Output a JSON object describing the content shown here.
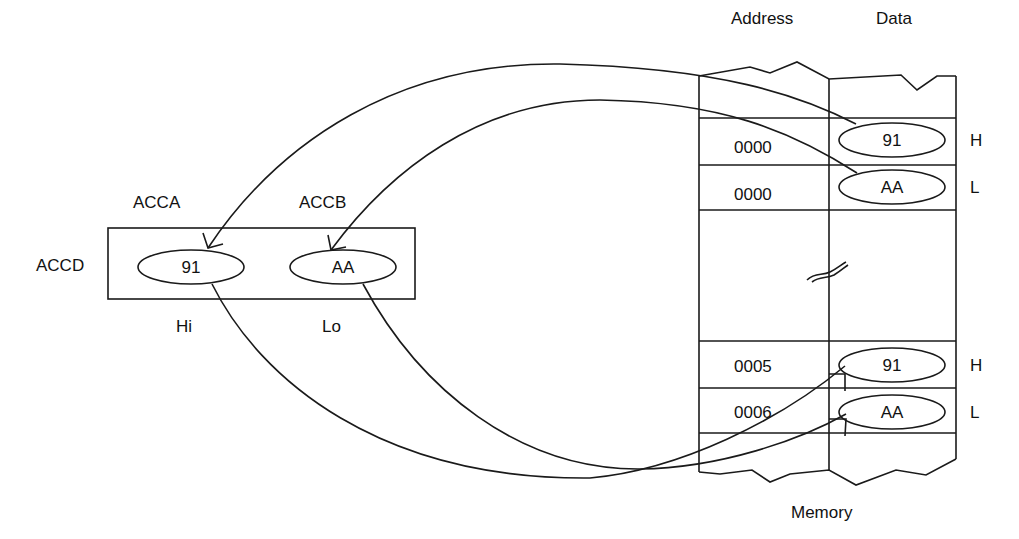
{
  "memory": {
    "title": "Memory",
    "column_headers": {
      "address": "Address",
      "data": "Data"
    },
    "rows": [
      {
        "address": "0000",
        "data": "91",
        "byte": "H"
      },
      {
        "address": "0000",
        "data": "AA",
        "byte": "L"
      },
      {
        "address": "0005",
        "data": "91",
        "byte": "H"
      },
      {
        "address": "0006",
        "data": "AA",
        "byte": "L"
      }
    ],
    "break_symbol": "≈"
  },
  "register": {
    "name": "ACCD",
    "high": {
      "name": "ACCA",
      "value": "91",
      "position": "Hi"
    },
    "low": {
      "name": "ACCB",
      "value": "AA",
      "position": "Lo"
    }
  },
  "arrows": [
    {
      "from": "memory.row0.data",
      "to": "register.high",
      "desc": "load H byte into ACCA"
    },
    {
      "from": "memory.row1.data",
      "to": "register.low",
      "desc": "load L byte into ACCB"
    },
    {
      "from": "register.high",
      "to": "memory.row2.data",
      "desc": "store ACCA to 0005"
    },
    {
      "from": "register.low",
      "to": "memory.row3.data",
      "desc": "store ACCB to 0006"
    }
  ]
}
